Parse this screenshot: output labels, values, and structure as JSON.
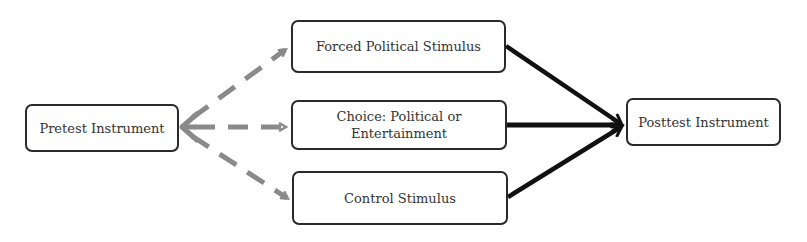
{
  "diagram": {
    "type": "flowchart",
    "nodes": {
      "pretest": {
        "label": "Pretest Instrument"
      },
      "forced": {
        "label": "Forced Political Stimulus"
      },
      "choice": {
        "label_line1": "Choice: Political or",
        "label_line2": "Entertainment",
        "label": "Choice: Political or Entertainment"
      },
      "control": {
        "label": "Control Stimulus"
      },
      "posttest": {
        "label": "Posttest Instrument"
      }
    },
    "edges": [
      {
        "from": "pretest",
        "to": "forced",
        "style": "dashed",
        "color": "#8a8a8a"
      },
      {
        "from": "pretest",
        "to": "choice",
        "style": "dashed",
        "color": "#8a8a8a"
      },
      {
        "from": "pretest",
        "to": "control",
        "style": "dashed",
        "color": "#8a8a8a"
      },
      {
        "from": "forced",
        "to": "posttest",
        "style": "solid",
        "color": "#111111"
      },
      {
        "from": "choice",
        "to": "posttest",
        "style": "solid",
        "color": "#111111"
      },
      {
        "from": "control",
        "to": "posttest",
        "style": "solid",
        "color": "#111111"
      }
    ],
    "colors": {
      "dashed_arrow": "#8a8a8a",
      "solid_arrow": "#111111",
      "node_border": "#2a2a2a",
      "node_text": "#333333"
    }
  }
}
